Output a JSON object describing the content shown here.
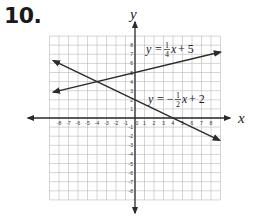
{
  "problem": {
    "number": "10."
  },
  "chart_data": {
    "type": "line",
    "title": "",
    "xlabel": "x",
    "ylabel": "y",
    "xlim": [
      -9,
      9
    ],
    "ylim": [
      -9,
      9
    ],
    "grid": true,
    "x_ticks": [
      -8,
      -7,
      -6,
      -5,
      -4,
      -3,
      -2,
      -1,
      0,
      1,
      2,
      3,
      4,
      5,
      6,
      7,
      8
    ],
    "y_ticks": [
      -8,
      -7,
      -6,
      -5,
      -4,
      -3,
      -2,
      -1,
      1,
      2,
      3,
      4,
      5,
      6,
      7,
      8
    ],
    "series": [
      {
        "name": "y = 1/4x + 5",
        "slope": 0.25,
        "intercept": 5,
        "x": [
          -8.6,
          9
        ],
        "y": [
          2.85,
          7.25
        ],
        "label": {
          "lhs": "y",
          "eq": "=",
          "num": "1",
          "den": "4",
          "rhs": "x + 5"
        }
      },
      {
        "name": "y = -1/2x + 2",
        "slope": -0.5,
        "intercept": 2,
        "x": [
          -8.6,
          8.9
        ],
        "y": [
          6.3,
          -2.45
        ],
        "label": {
          "lhs": "y",
          "eq": "= −",
          "num": "1",
          "den": "2",
          "rhs": "x + 2"
        }
      }
    ],
    "intersection": {
      "x": -4,
      "y": 4
    }
  }
}
